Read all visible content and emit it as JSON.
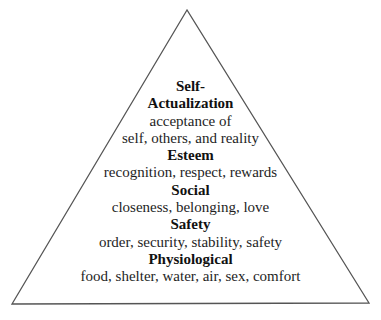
{
  "diagram": {
    "shape": "triangle",
    "stroke_color": "#555555",
    "levels": [
      {
        "name_lines": [
          "Self-",
          "Actualization"
        ],
        "description_lines": [
          "acceptance of",
          "self, others, and reality"
        ]
      },
      {
        "name_lines": [
          "Esteem"
        ],
        "description_lines": [
          "recognition, respect, rewards"
        ]
      },
      {
        "name_lines": [
          "Social"
        ],
        "description_lines": [
          "closeness, belonging, love"
        ]
      },
      {
        "name_lines": [
          "Safety"
        ],
        "description_lines": [
          "order, security, stability, safety"
        ]
      },
      {
        "name_lines": [
          "Physiological"
        ],
        "description_lines": [
          "food, shelter, water, air, sex, comfort"
        ]
      }
    ]
  }
}
